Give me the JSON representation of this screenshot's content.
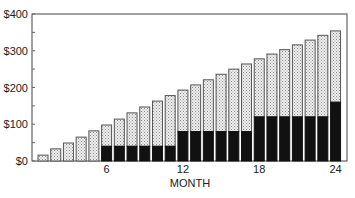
{
  "chart_data": {
    "type": "bar",
    "stacked": true,
    "title": "",
    "xlabel": "MONTH",
    "ylabel": "",
    "ylim": [
      0,
      400
    ],
    "yticks": [
      0,
      100,
      200,
      300,
      400
    ],
    "ytick_labels": [
      "$0",
      "$100",
      "$200",
      "$300",
      "$400"
    ],
    "y_minor_tick_step": 50,
    "xticks": [
      6,
      12,
      18,
      24
    ],
    "xtick_labels": [
      "6",
      "12",
      "18",
      "24"
    ],
    "grid": false,
    "legend": null,
    "categories": [
      1,
      2,
      3,
      4,
      5,
      6,
      7,
      8,
      9,
      10,
      11,
      12,
      13,
      14,
      15,
      16,
      17,
      18,
      19,
      20,
      21,
      22,
      23,
      24
    ],
    "series": [
      {
        "name": "dark (solid black) portion",
        "color": "#111111",
        "values": [
          0,
          0,
          0,
          0,
          0,
          40,
          40,
          40,
          40,
          40,
          40,
          80,
          80,
          80,
          80,
          80,
          80,
          120,
          120,
          120,
          120,
          120,
          120,
          160
        ]
      },
      {
        "name": "light (stippled) portion",
        "color": "#d9d9d9",
        "values": [
          16,
          33,
          49,
          65,
          82,
          58,
          74,
          91,
          107,
          123,
          138,
          113,
          127,
          141,
          156,
          170,
          184,
          158,
          171,
          183,
          196,
          209,
          222,
          194
        ]
      }
    ],
    "totals": [
      16,
      33,
      49,
      65,
      82,
      98,
      114,
      131,
      147,
      163,
      178,
      193,
      207,
      221,
      236,
      250,
      264,
      278,
      291,
      303,
      316,
      329,
      342,
      354
    ]
  }
}
